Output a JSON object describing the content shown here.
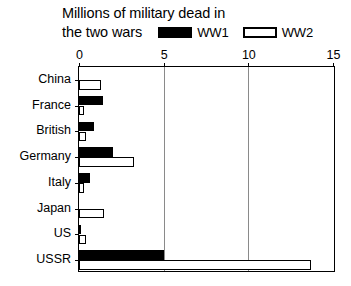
{
  "chart_data": {
    "type": "bar",
    "orientation": "horizontal",
    "title": "Millions of military dead in the two wars",
    "title_lines": [
      "Millions of military dead in",
      "the two wars"
    ],
    "xlabel": "",
    "ylabel": "",
    "xlim": [
      0,
      15
    ],
    "xticks": [
      0,
      5,
      10,
      15
    ],
    "xtick_labels": [
      "0",
      "5",
      "10",
      "15"
    ],
    "axis_position": "top",
    "grid": true,
    "gridlines_at": [
      5,
      10
    ],
    "legend_position": "top-right-inline",
    "categories": [
      "China",
      "France",
      "British",
      "Germany",
      "Italy",
      "Japan",
      "US",
      "USSR"
    ],
    "series": [
      {
        "name": "WW1",
        "color": "#000000",
        "style": "filled-black",
        "values": [
          0,
          1.4,
          0.9,
          2.0,
          0.65,
          0,
          0.12,
          5.0
        ]
      },
      {
        "name": "WW2",
        "color": "#ffffff",
        "style": "white-outlined",
        "values": [
          1.3,
          0.2,
          0.4,
          3.25,
          0.3,
          1.5,
          0.4,
          13.7
        ]
      }
    ]
  },
  "legend": {
    "entries": [
      {
        "label": "WW1",
        "swatch": "black-filled-swatch"
      },
      {
        "label": "WW2",
        "swatch": "white-outlined-swatch"
      }
    ]
  },
  "colors": {
    "ww1": "#000000",
    "ww2": "#ffffff",
    "outline": "#000000",
    "gridline": "#8a8a8a",
    "background": "#ffffff"
  }
}
